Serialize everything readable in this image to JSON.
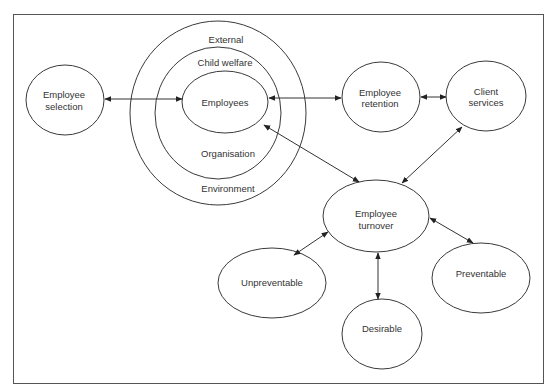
{
  "diagram": {
    "type": "relationship-diagram",
    "frame": {
      "x": 13,
      "y": 14,
      "w": 530,
      "h": 369
    },
    "nested_context": {
      "rings": [
        {
          "id": "external-environment",
          "top_label": "External",
          "bottom_label": "Environment"
        },
        {
          "id": "child-welfare-organisation",
          "top_label": "Child welfare",
          "bottom_label": "Organisation"
        },
        {
          "id": "employees",
          "label": "Employees"
        }
      ]
    },
    "nodes": {
      "employee_selection": {
        "line1": "Employee",
        "line2": "selection"
      },
      "employees": {
        "label": "Employees"
      },
      "employee_retention": {
        "line1": "Employee",
        "line2": "retention"
      },
      "client_services": {
        "line1": "Client",
        "line2": "services"
      },
      "employee_turnover": {
        "line1": "Employee",
        "line2": "turnover"
      },
      "unpreventable": {
        "label": "Unpreventable"
      },
      "desirable": {
        "label": "Desirable"
      },
      "preventable": {
        "label": "Preventable"
      }
    },
    "ring_labels": {
      "external": "External",
      "child_welfare": "Child welfare",
      "organisation": "Organisation",
      "environment": "Environment"
    },
    "edges": [
      {
        "from": "Employee selection",
        "to": "Employees",
        "direction": "both"
      },
      {
        "from": "Employees",
        "to": "Employee retention",
        "direction": "both"
      },
      {
        "from": "Employee retention",
        "to": "Client services",
        "direction": "both"
      },
      {
        "from": "Employees",
        "to": "Employee turnover",
        "direction": "both"
      },
      {
        "from": "Client services",
        "to": "Employee turnover",
        "direction": "both"
      },
      {
        "from": "Employee turnover",
        "to": "Unpreventable",
        "direction": "both"
      },
      {
        "from": "Employee turnover",
        "to": "Desirable",
        "direction": "both"
      },
      {
        "from": "Employee turnover",
        "to": "Preventable",
        "direction": "both"
      }
    ]
  }
}
